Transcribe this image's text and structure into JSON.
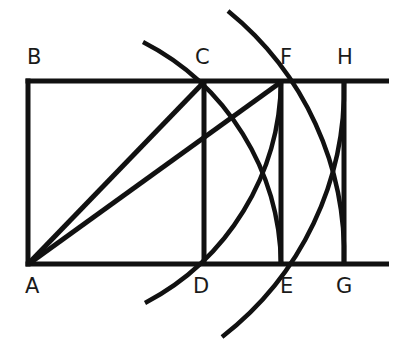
{
  "diagram": {
    "type": "geometric construction (root rectangles)",
    "colors": {
      "ink": "#111111",
      "background": "#ffffff"
    },
    "points": {
      "A": {
        "label": "A",
        "x": 28,
        "y": 264
      },
      "B": {
        "label": "B",
        "x": 28,
        "y": 81
      },
      "C": {
        "label": "C",
        "x": 203,
        "y": 81
      },
      "D": {
        "label": "D",
        "x": 203,
        "y": 264
      },
      "E": {
        "label": "E",
        "x": 281,
        "y": 264
      },
      "F": {
        "label": "F",
        "x": 281,
        "y": 81
      },
      "G": {
        "label": "G",
        "x": 344,
        "y": 264
      },
      "H": {
        "label": "H",
        "x": 344,
        "y": 81
      }
    },
    "labels": [
      "A",
      "B",
      "C",
      "D",
      "E",
      "F",
      "G",
      "H"
    ],
    "segments": [
      "B-top line",
      "A-bottom line",
      "AB",
      "CD",
      "FE",
      "HG",
      "AC",
      "AF"
    ],
    "arcs": [
      "center A radius AC: C to E",
      "center B radius BD: D to F",
      "center A radius AF: F to G",
      "center B radius BE: E to H"
    ]
  }
}
